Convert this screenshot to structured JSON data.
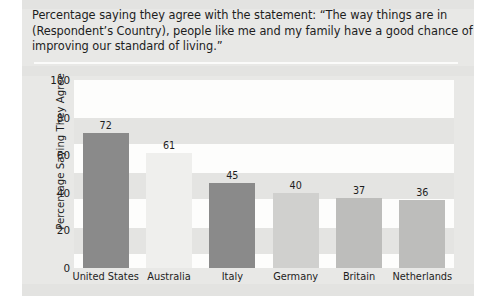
{
  "title": {
    "lines": [
      "Percentage saying they agree with the statement: “The way things are in",
      "(Respondent’s Country), people like me and my family have a good chance of",
      "improving our standard of living.”"
    ]
  },
  "chart_data": {
    "type": "bar",
    "title": "Percentage saying they agree with the statement: “The way things are in (Respondent’s Country), people like me and my family have a good chance of improving our standard of living.”",
    "xlabel": "",
    "ylabel": "Percentage Saying They Agree",
    "categories": [
      "United States",
      "Australia",
      "Italy",
      "Germany",
      "Britain",
      "Netherlands"
    ],
    "values": [
      72,
      61,
      45,
      40,
      37,
      36
    ],
    "bar_colors": [
      "#8a8a8a",
      "#efefed",
      "#8a8a8a",
      "#d0d0ce",
      "#bdbdbb",
      "#bdbdbb"
    ],
    "ylim": [
      0,
      100
    ],
    "yticks": [
      0,
      20,
      40,
      60,
      80,
      100
    ],
    "ytick_labels": [
      "0",
      "20",
      "40",
      "60",
      "80",
      "100"
    ],
    "grid": false,
    "legend": "none"
  },
  "colors": {
    "panel_background": "#e8e8e6",
    "plot_background": "#fdfdfc",
    "band": "#e4e4e2",
    "text": "#1d1d1d",
    "rule": "#fbfbfa"
  }
}
